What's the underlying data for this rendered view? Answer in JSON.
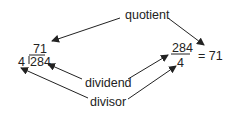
{
  "labels": {
    "quotient": "quotient",
    "dividend": "dividend",
    "divisor": "divisor"
  },
  "long_division": {
    "quotient": "71",
    "divisor": "4",
    "dividend": "284"
  },
  "fraction": {
    "numerator": "284",
    "denominator": "4",
    "result": "= 71"
  },
  "colors": {
    "text": "#222222",
    "arrow": "#222222"
  }
}
